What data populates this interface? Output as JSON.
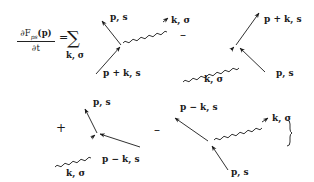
{
  "equation": {
    "lhs_numerator": "∂F",
    "lhs_subscript": "ps",
    "lhs_argument": "(p)",
    "lhs_denominator": "∂t",
    "equals": "=",
    "sum_symbol": "∑",
    "sum_index": "k, σ"
  },
  "operators": {
    "minus_1": "–",
    "plus": "+",
    "minus_2": "–"
  },
  "diagrams": [
    {
      "id": "absorption-outgoing-p",
      "labels": {
        "electron_out": "p, s",
        "electron_in": "p + k, s",
        "photon": "k, σ"
      },
      "photon_direction": "outgoing"
    },
    {
      "id": "absorption-incoming-photon",
      "labels": {
        "electron_out": "p + k, s",
        "electron_in": "p, s",
        "photon": "k, σ"
      },
      "photon_direction": "incoming"
    },
    {
      "id": "emission-incoming-photon",
      "labels": {
        "electron_out": "p, s",
        "electron_in": "p − k, s",
        "photon": "k, σ"
      },
      "photon_direction": "incoming"
    },
    {
      "id": "emission-outgoing-photon",
      "labels": {
        "electron_out": "p − k, s",
        "electron_in": "p, s",
        "photon": "k, σ"
      },
      "photon_direction": "outgoing"
    }
  ],
  "closing_brace": "}"
}
